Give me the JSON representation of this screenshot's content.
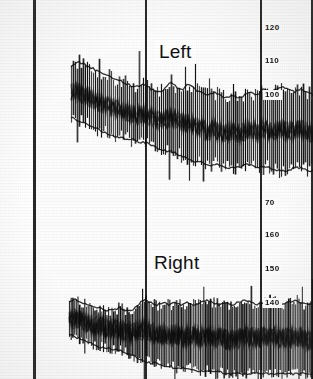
{
  "figure": {
    "background_color": "#ffffff",
    "ink_color": "#111111",
    "width_px": 313,
    "height_px": 379
  },
  "panels": [
    {
      "id": "left",
      "label": "Left"
    },
    {
      "id": "right",
      "label": "Right"
    }
  ],
  "axis": {
    "left_margin_px": 33,
    "plot_left_px": 33,
    "plot_right_px": 313,
    "vertical_gridlines_px": [
      33,
      145,
      260,
      311
    ],
    "minor_line_spacing_px": 6.8,
    "major_every_n_minor": 5,
    "y_ticks_upper": [
      {
        "label": "120",
        "y_px": 27
      },
      {
        "label": "110",
        "y_px": 60
      },
      {
        "label": "100",
        "y_px": 94
      },
      {
        "label": "70",
        "y_px": 202
      }
    ],
    "y_ticks_lower": [
      {
        "label": "160",
        "y_px": 234
      },
      {
        "label": "150",
        "y_px": 268
      },
      {
        "label": "140",
        "y_px": 302
      }
    ]
  },
  "chart_data": {
    "type": "line",
    "xlabel": "",
    "ylabel": "",
    "grid": true,
    "legend": "none",
    "annotations": [
      "Left",
      "Right"
    ],
    "panels": [
      {
        "name": "Left",
        "ylim": [
          60,
          128
        ],
        "ytick_labels": [
          "120",
          "110",
          "100",
          "70"
        ],
        "ytick_values": [
          120,
          110,
          100,
          70
        ],
        "description": "Dense high-frequency oscillatory pressure trace; envelope declines from onset then stabilises and broadens toward the right.",
        "envelope_upper": [
          104,
          106,
          105,
          104,
          103,
          102,
          101,
          100,
          99,
          98,
          97,
          97,
          98,
          96,
          95,
          96,
          99,
          97,
          96,
          98,
          96,
          95,
          94,
          95,
          94,
          93,
          94,
          93,
          94,
          95,
          94,
          96,
          95,
          96,
          97,
          96,
          95,
          96,
          95,
          94
        ],
        "envelope_lower": [
          86,
          85,
          84,
          83,
          82,
          81,
          80,
          79,
          79,
          78,
          78,
          77,
          77,
          76,
          75,
          74,
          74,
          73,
          72,
          71,
          70,
          70,
          69,
          69,
          69,
          68,
          68,
          68,
          69,
          69,
          68,
          68,
          68,
          67,
          67,
          67,
          68,
          68,
          67,
          67
        ],
        "mean_trend": [
          95,
          95,
          94,
          93,
          92,
          91,
          90,
          89,
          89,
          88,
          87,
          87,
          87,
          86,
          85,
          85,
          86,
          85,
          84,
          84,
          83,
          82,
          81,
          82,
          81,
          80,
          81,
          80,
          81,
          82,
          81,
          82,
          81,
          81,
          82,
          81,
          81,
          82,
          81,
          80
        ]
      },
      {
        "name": "Right",
        "ylim": [
          115,
          168
        ],
        "ytick_labels": [
          "160",
          "150",
          "140"
        ],
        "ytick_values": [
          160,
          150,
          140
        ],
        "description": "Second dense oscillatory pressure trace beginning lower-left; amplitude grows and the band thickens markedly toward the right of the record.",
        "envelope_upper": [
          144,
          145,
          144,
          143,
          142,
          142,
          141,
          141,
          142,
          141,
          141,
          143,
          145,
          144,
          143,
          144,
          143,
          144,
          143,
          144,
          143,
          144,
          145,
          144,
          143,
          144,
          143,
          144,
          145,
          144,
          143,
          144,
          145,
          144,
          143,
          144,
          145,
          144,
          143,
          144
        ],
        "envelope_lower": [
          132,
          131,
          130,
          129,
          128,
          127,
          127,
          126,
          126,
          125,
          124,
          123,
          122,
          121,
          121,
          120,
          120,
          119,
          119,
          119,
          118,
          118,
          118,
          118,
          118,
          117,
          117,
          117,
          117,
          117,
          117,
          117,
          117,
          117,
          117,
          117,
          117,
          117,
          117,
          117
        ],
        "mean_trend": [
          138,
          138,
          137,
          136,
          135,
          135,
          134,
          134,
          134,
          133,
          133,
          133,
          134,
          133,
          132,
          132,
          132,
          132,
          131,
          131,
          131,
          131,
          131,
          131,
          131,
          130,
          130,
          130,
          131,
          131,
          130,
          131,
          131,
          131,
          130,
          131,
          131,
          131,
          130,
          130
        ]
      }
    ]
  }
}
